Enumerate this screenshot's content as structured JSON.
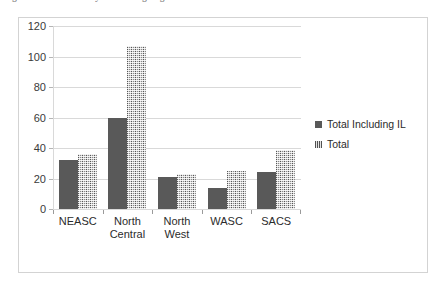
{
  "caption": {
    "text": "Figure 4.3   Institutions by Accrediting Region"
  },
  "chart_data": {
    "type": "bar",
    "title": "",
    "subtitle": "",
    "xlabel": "",
    "ylabel": "",
    "categories": [
      "NEASC",
      "North Central",
      "North West",
      "WASC",
      "SACS"
    ],
    "series": [
      {
        "name": "Total Including IL",
        "color": "#595959",
        "values": [
          32,
          60,
          21,
          14,
          24
        ]
      },
      {
        "name": "Total",
        "color": "#a6a6a6",
        "values": [
          36,
          107,
          23,
          25,
          39
        ]
      }
    ],
    "ylim": [
      0,
      120
    ],
    "ytick_values": [
      0,
      20,
      40,
      60,
      80,
      100,
      120
    ],
    "ytick_labels": [
      "0",
      "20",
      "40",
      "60",
      "80",
      "100",
      "120"
    ],
    "grid": "horizontal",
    "legend_position": "right",
    "legend_entries": [
      "Total Including IL",
      "Total"
    ]
  },
  "colors": {
    "series_dark": "#595959",
    "series_light": "#a6a6a6",
    "gridline": "#d9d9d9",
    "frame_border": "#d3d3d3",
    "axis": "#9a9a9a",
    "text": "#2b2b2b",
    "background": "#ffffff"
  }
}
